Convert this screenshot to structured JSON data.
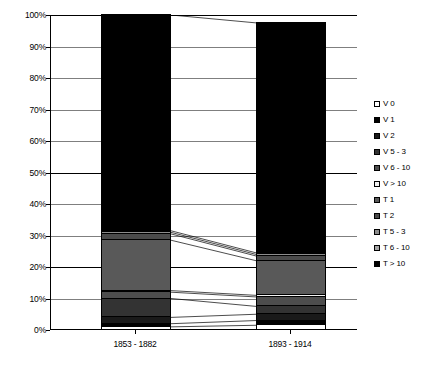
{
  "chart_data": {
    "type": "bar",
    "subtype": "stacked-100-percent-column",
    "title": "",
    "xlabel": "",
    "ylabel": "",
    "ylim": [
      0,
      100
    ],
    "ytick_labels": [
      "0%",
      "10%",
      "20%",
      "30%",
      "40%",
      "50%",
      "60%",
      "70%",
      "80%",
      "90%",
      "100%"
    ],
    "ytick_values": [
      0,
      10,
      20,
      30,
      40,
      50,
      60,
      70,
      80,
      90,
      100
    ],
    "grid": true,
    "legend_position": "right",
    "categories": [
      "1853 - 1882",
      "1893 - 1914"
    ],
    "series": [
      {
        "name": "V 0",
        "color": "#ffffff",
        "values": [
          1.0,
          1.5
        ]
      },
      {
        "name": "V 1",
        "color": "#000000",
        "values": [
          1.0,
          1.5
        ]
      },
      {
        "name": "V 2",
        "color": "#1a1a1a",
        "values": [
          2.0,
          2.0
        ]
      },
      {
        "name": "V 5 - 3",
        "color": "#333333",
        "values": [
          6.0,
          2.5
        ]
      },
      {
        "name": "V 6 - 10",
        "color": "#4d4d4d",
        "values": [
          2.0,
          3.0
        ]
      },
      {
        "name": "V > 10",
        "color": "#f2f2f2",
        "values": [
          0.5,
          0.5
        ]
      },
      {
        "name": "T 1",
        "color": "#595959",
        "values": [
          16.0,
          11.0
        ]
      },
      {
        "name": "T 2",
        "color": "#4a4a4a",
        "values": [
          2.0,
          1.5
        ]
      },
      {
        "name": "T 5 - 3",
        "color": "#8c8c8c",
        "values": [
          0.5,
          0.5
        ]
      },
      {
        "name": "T 6 - 10",
        "color": "#a6a6a6",
        "values": [
          0.5,
          0.5
        ]
      },
      {
        "name": "T > 10",
        "color": "#000000",
        "values": [
          68.5,
          73.0
        ]
      }
    ],
    "bar_totals": [
      100.0,
      97.0
    ]
  },
  "legend": {
    "items": [
      {
        "label": "V 0"
      },
      {
        "label": "V 1"
      },
      {
        "label": "V 2"
      },
      {
        "label": "V 5 - 3"
      },
      {
        "label": "V 6 - 10"
      },
      {
        "label": "V > 10"
      },
      {
        "label": "T 1"
      },
      {
        "label": "T 2"
      },
      {
        "label": "T 5 - 3"
      },
      {
        "label": "T 6 - 10"
      },
      {
        "label": "T > 10"
      }
    ]
  },
  "colors": {
    "axis": "#000000",
    "gridline": "#7f7f7f",
    "background": "#ffffff"
  }
}
